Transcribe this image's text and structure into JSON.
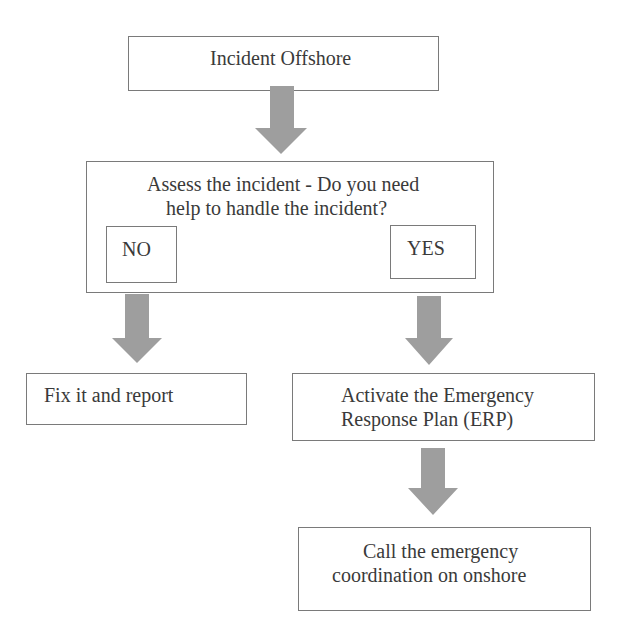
{
  "diagram": {
    "type": "flowchart",
    "arrow_color": "#9e9e9e",
    "border_color": "#7a7a7a",
    "text_color": "#3a3a3a",
    "nodes": {
      "start": {
        "label": "Incident Offshore"
      },
      "decision": {
        "line1": "Assess the incident - Do you need",
        "line2": "help to handle the incident?",
        "no_label": "NO",
        "yes_label": "YES"
      },
      "no_action": {
        "label": "Fix it and report"
      },
      "yes_action": {
        "line1": "Activate the Emergency",
        "line2": "Response Plan (ERP)"
      },
      "final": {
        "line1": "Call the emergency",
        "line2": "coordination on onshore"
      }
    },
    "edges": [
      {
        "from": "start",
        "to": "decision"
      },
      {
        "from": "decision.NO",
        "to": "no_action"
      },
      {
        "from": "decision.YES",
        "to": "yes_action"
      },
      {
        "from": "yes_action",
        "to": "final"
      }
    ]
  }
}
